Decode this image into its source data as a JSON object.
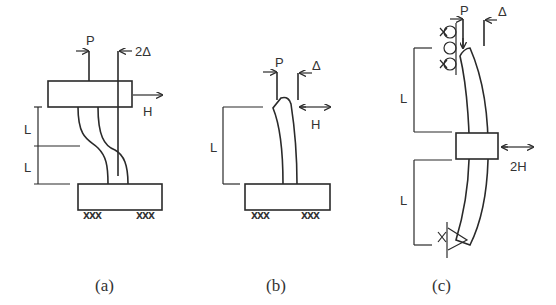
{
  "figure": {
    "panels": [
      {
        "id": "a",
        "caption": "(a)",
        "labels": {
          "load": "P",
          "displacement": "2Δ",
          "force": "H",
          "length_upper": "L",
          "length_lower": "L"
        },
        "description": "Fixed-fixed column between top block and base block, double curvature"
      },
      {
        "id": "b",
        "caption": "(b)",
        "labels": {
          "load": "P",
          "displacement": "Δ",
          "force": "H",
          "length": "L"
        },
        "description": "Cantilever column fixed at base, single curvature"
      },
      {
        "id": "c",
        "caption": "(c)",
        "labels": {
          "load": "P",
          "displacement": "Δ",
          "force": "2H",
          "length_upper": "L",
          "length_lower": "L"
        },
        "description": "Column with roller top support, pinned bottom, lateral load 2H at mid-height block"
      }
    ],
    "support_marks": "XXX"
  }
}
